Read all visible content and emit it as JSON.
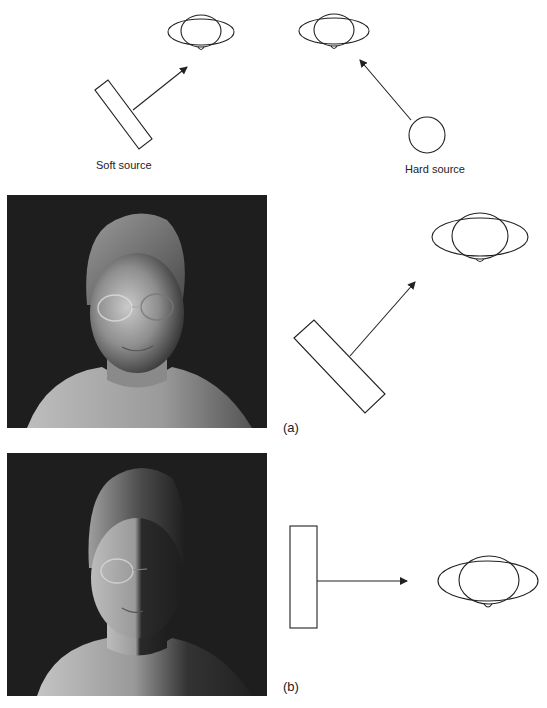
{
  "figure": {
    "top_diagram": {
      "soft_source_label": "Soft source",
      "hard_source_label": "Hard source"
    },
    "panels": [
      {
        "id": "a",
        "label": "(a)",
        "photo_description": "Portrait of woman with glasses lit by soft source at 45 degrees",
        "source_type": "soft source angled"
      },
      {
        "id": "b",
        "label": "(b)",
        "photo_description": "Portrait of woman with glasses lit by soft source from the side (split lighting)",
        "source_type": "soft source side"
      }
    ],
    "colors": {
      "line": "#222222",
      "photo_background": "#1c1c1c",
      "paper": "#ffffff"
    }
  }
}
